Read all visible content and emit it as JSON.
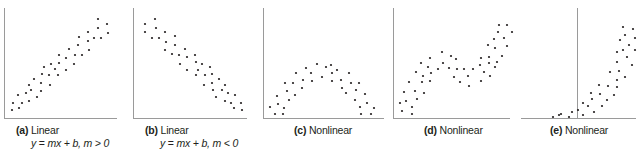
{
  "chart_data": [
    {
      "type": "scatter",
      "id": "a",
      "tag": "(a)",
      "title": "Linear",
      "formula": "y = mx + b, m > 0",
      "axes": {
        "yaxis_x": 4,
        "xaxis_y": 118,
        "x_from": 4,
        "x_to": 117,
        "y_top": 8
      },
      "points": [
        [
          12,
          110
        ],
        [
          13,
          103
        ],
        [
          19,
          108
        ],
        [
          18,
          95
        ],
        [
          22,
          103
        ],
        [
          26,
          93
        ],
        [
          29,
          85
        ],
        [
          29,
          101
        ],
        [
          31,
          90
        ],
        [
          34,
          79
        ],
        [
          37,
          97
        ],
        [
          41,
          91
        ],
        [
          41,
          83
        ],
        [
          42,
          74
        ],
        [
          44,
          67
        ],
        [
          49,
          75
        ],
        [
          50,
          85
        ],
        [
          51,
          64
        ],
        [
          55,
          69
        ],
        [
          58,
          75
        ],
        [
          59,
          63
        ],
        [
          59,
          55
        ],
        [
          66,
          58
        ],
        [
          66,
          70
        ],
        [
          69,
          49
        ],
        [
          74,
          64
        ],
        [
          75,
          55
        ],
        [
          78,
          45
        ],
        [
          79,
          37
        ],
        [
          82,
          55
        ],
        [
          88,
          41
        ],
        [
          88,
          32
        ],
        [
          89,
          50
        ],
        [
          94,
          38
        ],
        [
          98,
          28
        ],
        [
          98,
          19
        ],
        [
          101,
          38
        ],
        [
          107,
          24
        ],
        [
          108,
          33
        ]
      ]
    },
    {
      "type": "scatter",
      "id": "b",
      "tag": "(b)",
      "title": "Linear",
      "formula": "y = mx + b, m < 0",
      "axes": {
        "yaxis_x": 133,
        "xaxis_y": 118,
        "x_from": 133,
        "x_to": 247,
        "y_top": 8
      },
      "points": [
        [
          145,
          24
        ],
        [
          145,
          32
        ],
        [
          155,
          19
        ],
        [
          156,
          28
        ],
        [
          152,
          38
        ],
        [
          159,
          38
        ],
        [
          165,
          32
        ],
        [
          166,
          42
        ],
        [
          165,
          50
        ],
        [
          175,
          36
        ],
        [
          175,
          45
        ],
        [
          172,
          54
        ],
        [
          179,
          55
        ],
        [
          185,
          49
        ],
        [
          180,
          64
        ],
        [
          187,
          57
        ],
        [
          187,
          70
        ],
        [
          195,
          55
        ],
        [
          196,
          62
        ],
        [
          198,
          70
        ],
        [
          196,
          75
        ],
        [
          202,
          64
        ],
        [
          205,
          75
        ],
        [
          204,
          85
        ],
        [
          210,
          67
        ],
        [
          212,
          74
        ],
        [
          212,
          83
        ],
        [
          213,
          90
        ],
        [
          219,
          79
        ],
        [
          222,
          90
        ],
        [
          216,
          97
        ],
        [
          225,
          85
        ],
        [
          228,
          93
        ],
        [
          225,
          101
        ],
        [
          231,
          103
        ],
        [
          235,
          95
        ],
        [
          234,
          108
        ],
        [
          241,
          103
        ],
        [
          242,
          110
        ]
      ]
    },
    {
      "type": "scatter",
      "id": "c",
      "tag": "(c)",
      "title": "Nonlinear",
      "formula": "",
      "axes": {
        "yaxis_x": 263,
        "xaxis_y": 118,
        "x_from": 263,
        "x_to": 384,
        "y_top": 8
      },
      "points": [
        [
          270,
          107
        ],
        [
          275,
          114
        ],
        [
          277,
          96
        ],
        [
          278,
          104
        ],
        [
          283,
          114
        ],
        [
          284,
          108
        ],
        [
          285,
          83
        ],
        [
          287,
          91
        ],
        [
          289,
          100
        ],
        [
          293,
          83
        ],
        [
          295,
          95
        ],
        [
          296,
          73
        ],
        [
          302,
          88
        ],
        [
          303,
          80
        ],
        [
          306,
          68
        ],
        [
          311,
          73
        ],
        [
          312,
          81
        ],
        [
          317,
          64
        ],
        [
          322,
          77
        ],
        [
          326,
          67
        ],
        [
          331,
          65
        ],
        [
          332,
          73
        ],
        [
          332,
          81
        ],
        [
          337,
          70
        ],
        [
          341,
          80
        ],
        [
          342,
          88
        ],
        [
          346,
          93
        ],
        [
          349,
          73
        ],
        [
          351,
          83
        ],
        [
          355,
          100
        ],
        [
          356,
          90
        ],
        [
          359,
          83
        ],
        [
          360,
          107
        ],
        [
          361,
          114
        ],
        [
          365,
          94
        ],
        [
          367,
          103
        ],
        [
          371,
          114
        ],
        [
          374,
          108
        ]
      ]
    },
    {
      "type": "scatter",
      "id": "d",
      "tag": "(d)",
      "title": "Nonlinear",
      "formula": "",
      "axes": {
        "yaxis_x": 393,
        "xaxis_y": 118,
        "x_from": 393,
        "x_to": 510,
        "y_top": 8
      },
      "points": [
        [
          400,
          103
        ],
        [
          402,
          111
        ],
        [
          404,
          92
        ],
        [
          406,
          101
        ],
        [
          409,
          82
        ],
        [
          412,
          107
        ],
        [
          412,
          114
        ],
        [
          415,
          91
        ],
        [
          416,
          72
        ],
        [
          417,
          99
        ],
        [
          421,
          63
        ],
        [
          422,
          82
        ],
        [
          423,
          76
        ],
        [
          424,
          93
        ],
        [
          428,
          67
        ],
        [
          430,
          58
        ],
        [
          430,
          81
        ],
        [
          431,
          73
        ],
        [
          438,
          69
        ],
        [
          442,
          52
        ],
        [
          443,
          63
        ],
        [
          449,
          68
        ],
        [
          451,
          56
        ],
        [
          454,
          77
        ],
        [
          456,
          59
        ],
        [
          457,
          69
        ],
        [
          460,
          82
        ],
        [
          464,
          69
        ],
        [
          468,
          76
        ],
        [
          469,
          86
        ],
        [
          473,
          69
        ],
        [
          480,
          65
        ],
        [
          481,
          81
        ],
        [
          481,
          58
        ],
        [
          484,
          72
        ],
        [
          488,
          45
        ],
        [
          489,
          63
        ],
        [
          489,
          57
        ],
        [
          490,
          76
        ],
        [
          494,
          39
        ],
        [
          495,
          48
        ],
        [
          495,
          67
        ],
        [
          497,
          62
        ],
        [
          498,
          32
        ],
        [
          499,
          25
        ],
        [
          502,
          56
        ],
        [
          504,
          38
        ],
        [
          507,
          25
        ],
        [
          507,
          46
        ],
        [
          512,
          32
        ]
      ]
    },
    {
      "type": "scatter",
      "id": "e",
      "tag": "(e)",
      "title": "Nonlinear",
      "formula": "",
      "axes": {
        "yaxis_x": 577,
        "xaxis_y": 118,
        "x_from": 521,
        "x_to": 636,
        "y_top": 8
      },
      "points": [
        [
          553,
          117
        ],
        [
          559,
          115
        ],
        [
          561,
          114
        ],
        [
          569,
          117
        ],
        [
          572,
          112
        ],
        [
          578,
          110
        ],
        [
          583,
          115
        ],
        [
          583,
          103
        ],
        [
          588,
          106
        ],
        [
          591,
          93
        ],
        [
          592,
          99
        ],
        [
          594,
          112
        ],
        [
          599,
          85
        ],
        [
          600,
          94
        ],
        [
          602,
          106
        ],
        [
          607,
          100
        ],
        [
          608,
          86
        ],
        [
          610,
          72
        ],
        [
          614,
          95
        ],
        [
          617,
          80
        ],
        [
          617,
          87
        ],
        [
          617,
          62
        ],
        [
          617,
          52
        ],
        [
          619,
          71
        ],
        [
          620,
          40
        ],
        [
          623,
          27
        ],
        [
          623,
          50
        ],
        [
          625,
          77
        ],
        [
          625,
          35
        ],
        [
          627,
          57
        ],
        [
          629,
          45
        ],
        [
          632,
          65
        ],
        [
          633,
          29
        ],
        [
          635,
          38
        ],
        [
          635,
          50
        ]
      ]
    }
  ],
  "captions": [
    {
      "tag": "(a)",
      "label": "Linear",
      "formula_lhs": "y",
      "formula_eq": " = ",
      "formula_rhs": "mx + b, m > 0",
      "x": 16,
      "y": 124,
      "fx": 31,
      "fy": 137
    },
    {
      "tag": "(b)",
      "label": "Linear",
      "formula_lhs": "y",
      "formula_eq": " = ",
      "formula_rhs": "mx + b, m < 0",
      "x": 145,
      "y": 124,
      "fx": 160,
      "fy": 137
    },
    {
      "tag": "(c)",
      "label": "Nonlinear",
      "x": 294,
      "y": 124
    },
    {
      "tag": "(d)",
      "label": "Nonlinear",
      "x": 424,
      "y": 124
    },
    {
      "tag": "(e)",
      "label": "Nonlinear",
      "x": 550,
      "y": 124
    }
  ],
  "style": {
    "axis_color": "#9a9a9a",
    "dot_color": "#231f20",
    "dot_radius": 1.1
  }
}
